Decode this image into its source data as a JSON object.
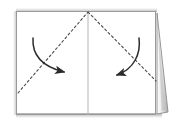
{
  "figure": {
    "type": "origami-fold-instruction",
    "canvas": {
      "width": 173,
      "height": 127
    },
    "background_color": "#ffffff"
  },
  "paper": {
    "name": "open-sheet",
    "fill_color": "#ffffff",
    "edge_color": "#9a9a9a",
    "shadow_color": "#cfcfcf",
    "left": 16,
    "top": 11,
    "right": 156,
    "bottom": 115
  },
  "center_fold": {
    "name": "vertical-spine",
    "label": "center fold line",
    "color": "#b4b4b4",
    "x": 88,
    "y_top": 11,
    "y_bottom": 115,
    "stroke_width": 1
  },
  "fold_lines": [
    {
      "id": "left-diagonal",
      "label": "left dashed fold line",
      "style": "dashed",
      "color": "#4a4a4a",
      "x1": 18,
      "y1": 93,
      "x2": 88,
      "y2": 12
    },
    {
      "id": "right-diagonal",
      "label": "right dashed fold line",
      "style": "dashed",
      "color": "#4a4a4a",
      "x1": 88,
      "y1": 12,
      "x2": 156,
      "y2": 81
    }
  ],
  "arrows": [
    {
      "id": "left-fold-arrow",
      "label": "fold left corner inward",
      "color": "#2b2b2b",
      "direction": "clockwise-right",
      "start_x": 33,
      "start_y": 38,
      "end_x": 69,
      "end_y": 73
    },
    {
      "id": "right-fold-arrow",
      "label": "fold right corner inward",
      "color": "#2b2b2b",
      "direction": "counterclockwise-left",
      "start_x": 139,
      "start_y": 38,
      "end_x": 112,
      "end_y": 76
    }
  ],
  "page_wedge": {
    "name": "turning-page-wedge",
    "label": "lifted page edge",
    "fill_color": "#f2f2f2",
    "edge_color": "#8c8c8c",
    "shade_color": "#b9b9b9",
    "apex_x": 157,
    "apex_y": 13,
    "base_outer_x": 168,
    "base_outer_y": 112,
    "base_inner_x": 157,
    "base_inner_y": 114
  }
}
